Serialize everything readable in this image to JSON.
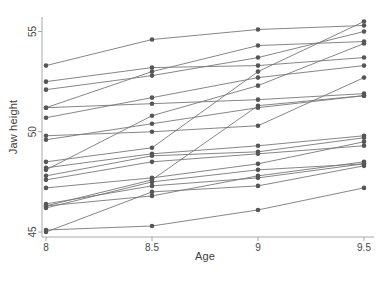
{
  "chart_data": {
    "type": "line",
    "title": "",
    "xlabel": "Age",
    "ylabel": "Jaw height",
    "x": [
      8,
      8.5,
      9,
      9.5
    ],
    "x_tick_labels": [
      "8",
      "8.5",
      "9",
      "9.5"
    ],
    "y_ticks": [
      45,
      50,
      55
    ],
    "y_tick_labels": [
      "45",
      "50",
      "55"
    ],
    "xlim": [
      8,
      9.5
    ],
    "ylim": [
      44.7,
      55.7
    ],
    "grid": false,
    "legend": "none",
    "marker": "filled-circle",
    "series": [
      {
        "values": [
          47.8,
          48.8,
          49.0,
          49.7
        ]
      },
      {
        "values": [
          46.4,
          47.3,
          47.7,
          48.4
        ]
      },
      {
        "values": [
          46.3,
          46.8,
          47.8,
          48.5
        ]
      },
      {
        "values": [
          45.1,
          45.3,
          46.1,
          47.2
        ]
      },
      {
        "values": [
          47.6,
          48.5,
          48.9,
          49.3
        ]
      },
      {
        "values": [
          52.5,
          53.2,
          53.3,
          53.7
        ]
      },
      {
        "values": [
          51.2,
          53.0,
          54.3,
          54.5
        ]
      },
      {
        "values": [
          49.8,
          50.0,
          50.3,
          52.7
        ]
      },
      {
        "values": [
          48.1,
          50.8,
          52.3,
          54.4
        ]
      },
      {
        "values": [
          45.0,
          47.0,
          47.3,
          48.3
        ]
      },
      {
        "values": [
          51.2,
          51.4,
          51.6,
          51.9
        ]
      },
      {
        "values": [
          48.5,
          49.2,
          53.0,
          55.5
        ]
      },
      {
        "values": [
          52.1,
          52.8,
          53.7,
          55.0
        ]
      },
      {
        "values": [
          48.2,
          48.9,
          49.3,
          49.8
        ]
      },
      {
        "values": [
          49.6,
          50.4,
          51.2,
          51.8
        ]
      },
      {
        "values": [
          50.7,
          51.7,
          52.7,
          53.3
        ]
      },
      {
        "values": [
          47.2,
          47.7,
          48.4,
          49.5
        ]
      },
      {
        "values": [
          53.3,
          54.6,
          55.1,
          55.3
        ]
      },
      {
        "values": [
          46.2,
          47.5,
          48.1,
          48.4
        ]
      },
      {
        "values": [
          46.3,
          47.6,
          51.3,
          51.8
        ]
      }
    ],
    "colors": {
      "point": "#565656",
      "line": "#787878",
      "axis": "#a8a8a8",
      "tick_text": "#474747",
      "background": "#ffffff"
    }
  }
}
